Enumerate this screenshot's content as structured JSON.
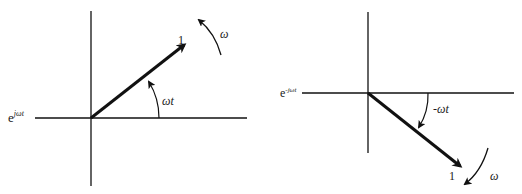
{
  "left_diagram": {
    "expression": {
      "base": "e",
      "exponent": "jωt"
    },
    "vector_magnitude_label": "1",
    "angle_label": "ωt",
    "rotation_label": "ω",
    "rotation_direction": "counterclockwise"
  },
  "right_diagram": {
    "expression": {
      "base": "e",
      "exponent": "-jωt"
    },
    "vector_magnitude_label": "1",
    "angle_label": "-ωt",
    "rotation_label": "ω",
    "rotation_direction": "clockwise"
  },
  "colors": {
    "stroke": "#111111",
    "background": "#ffffff"
  }
}
